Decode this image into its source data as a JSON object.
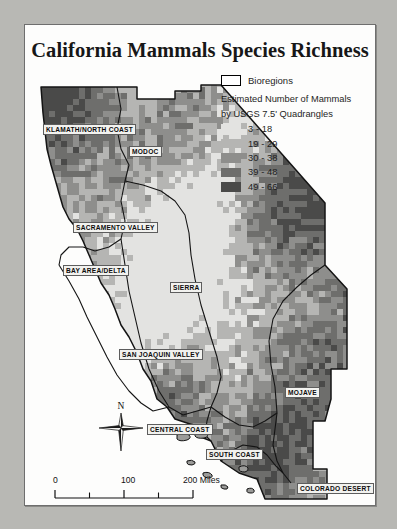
{
  "poster": {
    "title": "California Mammals Species Richness"
  },
  "legend": {
    "bioregions_label": "Bioregions",
    "subtitle_line1": "Estimated Number of Mammals",
    "subtitle_line2": "by USGS 7.5' Quadrangles",
    "classes": [
      {
        "label": "3 - 18",
        "color": "#e3e3e1"
      },
      {
        "label": "19 - 29",
        "color": "#b5b5b3"
      },
      {
        "label": "30 - 38",
        "color": "#8e8e8c"
      },
      {
        "label": "39 - 48",
        "color": "#6e6e6c"
      },
      {
        "label": "49 - 66",
        "color": "#4a4a49"
      }
    ]
  },
  "north_arrow": {
    "label": "N"
  },
  "scale_bar": {
    "ticks": [
      "0",
      "100",
      "200 Miles"
    ],
    "units": "Miles",
    "max_value": 200
  },
  "bioregions": [
    {
      "name": "KLAMATH/NORTH COAST",
      "x": 18,
      "y": 55
    },
    {
      "name": "MODOC",
      "x": 104,
      "y": 77
    },
    {
      "name": "SACRAMENTO VALLEY",
      "x": 48,
      "y": 153
    },
    {
      "name": "BAY AREA/DELTA",
      "x": 38,
      "y": 196
    },
    {
      "name": "SIERRA",
      "x": 145,
      "y": 213
    },
    {
      "name": "SAN JOAQUIN VALLEY",
      "x": 94,
      "y": 280
    },
    {
      "name": "CENTRAL COAST",
      "x": 122,
      "y": 355
    },
    {
      "name": "MOJAVE",
      "x": 260,
      "y": 318
    },
    {
      "name": "SOUTH COAST",
      "x": 181,
      "y": 380
    },
    {
      "name": "COLORADO DESERT",
      "x": 272,
      "y": 414
    }
  ],
  "chart_data": {
    "type": "heatmap",
    "title": "California Mammals Species Richness",
    "legend_title": "Estimated Number of Mammals by USGS 7.5' Quadrangles",
    "class_breaks": [
      {
        "range": "3 - 18",
        "min": 3,
        "max": 18,
        "color": "#e3e3e1"
      },
      {
        "range": "19 - 29",
        "min": 19,
        "max": 29,
        "color": "#b5b5b3"
      },
      {
        "range": "30 - 38",
        "min": 30,
        "max": 38,
        "color": "#8e8e8c"
      },
      {
        "range": "39 - 48",
        "min": 39,
        "max": 48,
        "color": "#6e6e6c"
      },
      {
        "range": "49 - 66",
        "min": 49,
        "max": 66,
        "color": "#4a4a49"
      }
    ],
    "overlay": "Bioregions",
    "scale_max_miles": 200
  }
}
